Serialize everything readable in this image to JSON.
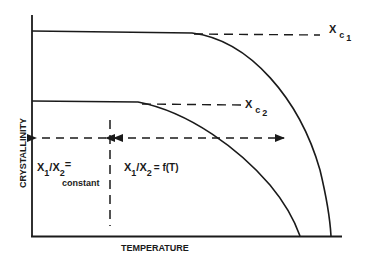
{
  "diagram": {
    "x_axis_label": "TEMPERATURE",
    "y_axis_label": "CRYSTALLINITY",
    "curve_labels": {
      "upper": {
        "base": "X",
        "sub1": "c",
        "sub2": "1"
      },
      "lower": {
        "base": "X",
        "sub1": "c",
        "sub2": "2"
      }
    },
    "regions": {
      "left": {
        "line1": "X",
        "sub_a": "1",
        "slash": "/X",
        "sub_b": "2",
        "eq": "=",
        "line2": "constant"
      },
      "right": {
        "text_a": "X",
        "sub_a": "1",
        "slash": "/X",
        "sub_b": "2",
        "eq": "= f(T)"
      }
    },
    "colors": {
      "ink": "#1a1a1a",
      "background": "#ffffff"
    }
  }
}
